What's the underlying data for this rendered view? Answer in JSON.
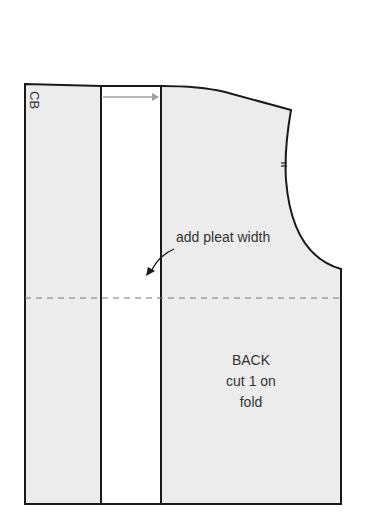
{
  "diagram": {
    "labels": {
      "cb": "CB",
      "annotation": "add pleat width",
      "piece_line1": "BACK",
      "piece_line2": "cut 1 on",
      "piece_line3": "fold"
    },
    "colors": {
      "fill": "#ececec",
      "outline": "#1a1a1a",
      "pleat_fill": "#ffffff",
      "arrow": "#a0a0a0",
      "dash": "#777777",
      "text": "#333333"
    }
  }
}
